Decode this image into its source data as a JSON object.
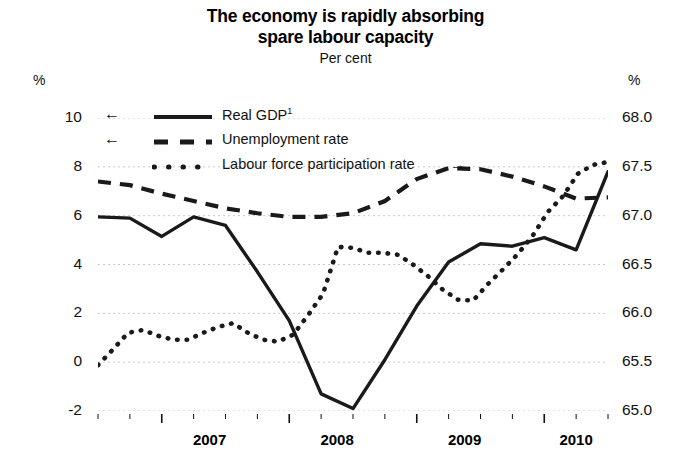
{
  "title": {
    "line1": "The economy is rapidly absorbing",
    "line2": "spare labour capacity",
    "subtitle": "Per cent"
  },
  "axes": {
    "left_unit": "%",
    "right_unit": "%",
    "left_ticks": [
      "10",
      "8",
      "6",
      "4",
      "2",
      "0",
      "-2"
    ],
    "right_ticks": [
      "68.0",
      "67.5",
      "67.0",
      "66.5",
      "66.0",
      "65.5",
      "65.0"
    ],
    "x_ticks": [
      "2007",
      "2008",
      "2009",
      "2010"
    ]
  },
  "legend": {
    "items": [
      {
        "label": "Real GDP",
        "footnote": "1",
        "style": "solid",
        "arrow": "←",
        "arrow_side": "left"
      },
      {
        "label": "Unemployment rate",
        "footnote": "",
        "style": "dashed",
        "arrow": "←",
        "arrow_side": "left"
      },
      {
        "label": "Labour force participation rate",
        "footnote": "",
        "style": "dotted",
        "arrow": "→",
        "arrow_side": "right"
      }
    ]
  },
  "chart_data": {
    "type": "line",
    "title": "The economy is rapidly absorbing spare labour capacity",
    "subtitle": "Per cent",
    "xlabel": "",
    "ylabel": "Per cent",
    "x": [
      "2006Q3",
      "2006Q4",
      "2007Q1",
      "2007Q2",
      "2007Q3",
      "2007Q4",
      "2008Q1",
      "2008Q2",
      "2008Q3",
      "2008Q4",
      "2009Q1",
      "2009Q2",
      "2009Q3",
      "2009Q4",
      "2010Q1",
      "2010Q2",
      "2010Q3"
    ],
    "xlim": [
      "2006Q3",
      "2010Q3"
    ],
    "ylim": [
      -2,
      10
    ],
    "ylim_right": [
      65.0,
      68.0
    ],
    "grid": true,
    "legend_position": "upper-left",
    "series": [
      {
        "name": "Real GDP",
        "axis": "left",
        "style": "solid",
        "color": "#1a1a1a",
        "values": [
          5.95,
          5.9,
          5.15,
          5.95,
          5.6,
          3.7,
          1.7,
          -1.3,
          -1.9,
          0.1,
          2.3,
          4.1,
          4.85,
          4.75,
          5.1,
          4.6,
          7.8
        ]
      },
      {
        "name": "Unemployment rate",
        "axis": "left",
        "style": "dashed",
        "color": "#1a1a1a",
        "values_left": [
          7.4,
          7.25,
          6.9,
          6.6,
          6.3,
          6.1,
          5.95,
          5.95,
          6.1,
          6.6,
          7.5,
          7.95,
          7.9,
          7.6,
          7.2,
          6.7,
          6.75
        ],
        "values_right": [
          67.35,
          67.31,
          67.23,
          67.15,
          67.08,
          67.03,
          66.99,
          66.99,
          67.03,
          67.15,
          67.38,
          67.49,
          67.48,
          67.4,
          67.3,
          67.18,
          67.19
        ]
      },
      {
        "name": "Labour force participation rate",
        "axis": "right",
        "style": "dotted",
        "color": "#1a1a1a",
        "values_right": [
          65.47,
          65.63,
          65.8,
          65.83,
          65.77,
          65.73,
          65.73,
          65.8,
          65.86,
          65.9,
          65.8,
          65.73,
          65.71,
          65.78,
          65.98,
          66.2,
          66.68,
          66.67,
          66.62,
          66.62,
          66.6,
          66.5,
          66.38,
          66.24,
          66.14,
          66.13,
          66.3,
          66.45,
          66.61,
          66.8,
          67.04,
          67.2,
          67.43,
          67.52,
          67.55
        ]
      }
    ]
  }
}
